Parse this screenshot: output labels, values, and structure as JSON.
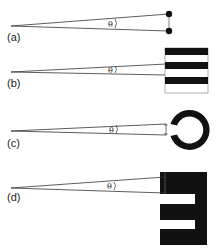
{
  "diagram": {
    "panels": [
      {
        "id": "a",
        "label": "(a)",
        "angle_symbol": "θ",
        "target": "two-point"
      },
      {
        "id": "b",
        "label": "(b)",
        "angle_symbol": "θ",
        "target": "grating"
      },
      {
        "id": "c",
        "label": "(c)",
        "angle_symbol": "θ",
        "target": "landolt-c"
      },
      {
        "id": "d",
        "label": "(d)",
        "angle_symbol": "θ",
        "target": "tumbling-e"
      }
    ],
    "colors": {
      "ink": "#111111",
      "background": "#ffffff"
    }
  }
}
